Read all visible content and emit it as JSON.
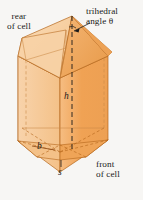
{
  "figure": {
    "background_color": "#f7f6f4",
    "solid": {
      "name": "honeycomb cell",
      "description": "hexagonal prism capped by a trihedral roof of three congruent rhombi",
      "face_colors": {
        "front_right": "#f0a254",
        "front_left": "#f6c894",
        "light_left": "#f8d5ad",
        "roof_light": "#f9d9b3",
        "roof_mid": "#f2b069",
        "roof_dark": "#e99b4a",
        "base": "#f3b877"
      },
      "edge_color": "#b4651a",
      "hidden_edge_color": "#c98a46",
      "outline_color": "#a2551a"
    }
  },
  "labels": {
    "rear": {
      "line1": "rear",
      "line2": "of cell"
    },
    "trihedral": {
      "line1": "trihedral",
      "line2": "angle θ"
    },
    "front": {
      "line1": "front",
      "line2": "of cell"
    },
    "height": "h",
    "b": "b",
    "s": "s"
  },
  "annotations": {
    "angle_symbol": "θ",
    "leader": "line from trihedral angle label to apex vertex",
    "axis": "dashed vertical axis of height h"
  }
}
